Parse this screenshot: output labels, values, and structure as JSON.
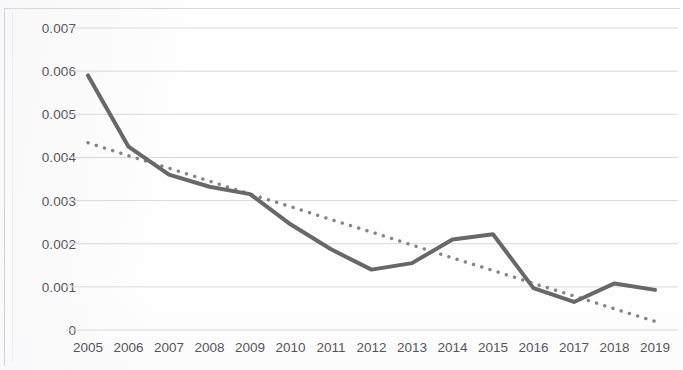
{
  "chart_data": {
    "type": "line",
    "title": "",
    "subtitle": "",
    "xlabel": "",
    "ylabel": "",
    "categories": [
      "2005",
      "2006",
      "2007",
      "2008",
      "2009",
      "2010",
      "2011",
      "2012",
      "2013",
      "2014",
      "2015",
      "2016",
      "2017",
      "2018",
      "2019"
    ],
    "series": [
      {
        "name": "data",
        "style": "solid",
        "color": "#5b5b5b",
        "values": [
          0.0059,
          0.00425,
          0.0036,
          0.00332,
          0.00315,
          0.00245,
          0.00187,
          0.0014,
          0.00155,
          0.0021,
          0.00222,
          0.00097,
          0.00065,
          0.00108,
          0.00093
        ]
      },
      {
        "name": "linear trendline",
        "style": "dotted",
        "color": "#6a6a6a",
        "values": [
          0.00434,
          0.00404,
          0.00375,
          0.00345,
          0.00315,
          0.00286,
          0.00256,
          0.00227,
          0.00197,
          0.00167,
          0.00138,
          0.00108,
          0.00079,
          0.00049,
          0.0002
        ]
      }
    ],
    "ylim": [
      0,
      0.007
    ],
    "ytick_values": [
      0.007,
      0.006,
      0.005,
      0.004,
      0.003,
      0.002,
      0.001,
      0
    ],
    "ytick_labels": [
      "0.007",
      "0.006",
      "0.005",
      "0.004",
      "0.003",
      "0.002",
      "0.001",
      "0"
    ],
    "grid": true,
    "grid_axis": "y",
    "grid_color": "#d9d9dd",
    "legend": false,
    "legend_position": "none",
    "annotations": []
  },
  "artifacts": {
    "ghost_text_1": "",
    "ghost_text_2": ""
  }
}
